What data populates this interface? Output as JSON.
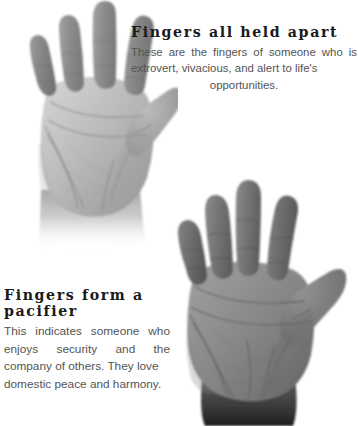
{
  "page": {
    "background_color": "#ffffff",
    "text_color_heading": "#1a1a1a",
    "text_color_body": "#545454"
  },
  "entries": [
    {
      "id": "fingers-all-held-apart",
      "title": "Fingers all held apart",
      "body": "These are the fingers of someone who is extrovert, vivacious, and alert to life's",
      "body_last_line": "opportunities.",
      "body_full": "These are the fingers of someone who is extrovert, vivacious, and alert to life's opportunities.",
      "alignment": "justify",
      "position": "top-right"
    },
    {
      "id": "fingers-form-a-pacifier",
      "title": "Fingers form a pacifier",
      "body": "This indicates someone who enjoys security and the company of others. They love",
      "body_last_line": "domestic peace and harmony.",
      "body_full": "This indicates someone who enjoys security and the company of others. They love domestic peace and harmony.",
      "alignment": "justify",
      "position": "bottom-left"
    }
  ],
  "figures": [
    {
      "id": "hand-fingers-apart",
      "name": "open-palm-photograph-fingers-spread",
      "description": "Greyscale photograph of a left open palm with all five fingers held widely apart",
      "position": "top-left",
      "palm_tone": "#b9b9b9",
      "finger_tone": "#8f8f8f",
      "shadow_tone": "#6e6e6e"
    },
    {
      "id": "hand-fingers-pacifier",
      "name": "open-palm-photograph-fingers-pacifier",
      "description": "Greyscale photograph of a left open palm with the fingers held close together forming a pacifier",
      "position": "bottom-right",
      "palm_tone": "#8a8a8a",
      "finger_tone": "#707070",
      "shadow_tone": "#4a4a4a"
    }
  ]
}
